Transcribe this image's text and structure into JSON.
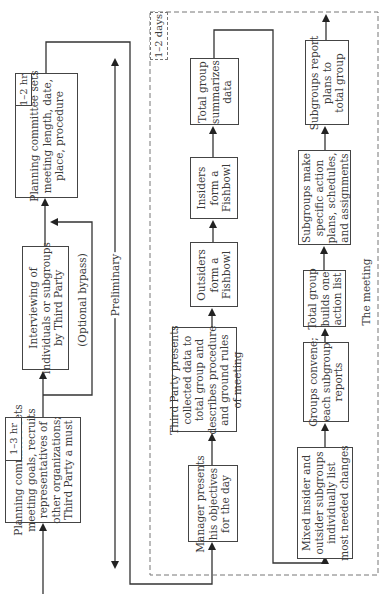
{
  "diagram": {
    "preliminary": {
      "label": "Preliminary",
      "steps": [
        {
          "id": "goals",
          "duration": "1–3 hr",
          "lines": [
            "Planning committee sets",
            "meeting goals, recruits",
            "representatives of",
            "other organizations;",
            "Third Party a must"
          ]
        },
        {
          "id": "interview",
          "lines": [
            "Interviewing of",
            "individuals or subgroups",
            "by Third Party"
          ]
        },
        {
          "id": "logistics",
          "duration": "1–2 hr",
          "lines": [
            "Planning committee sets",
            "meeting length, date,",
            "place, procedure"
          ]
        }
      ],
      "bypass_label": "(Optional bypass)"
    },
    "meeting": {
      "label": "The meeting",
      "duration": "1–2 days",
      "column_a": [
        {
          "id": "manager",
          "lines": [
            "Manager presents",
            "his objectives",
            "for the day"
          ]
        },
        {
          "id": "third-party",
          "lines": [
            "Third Party presents",
            "collected data to",
            "total group and",
            "describes procedure",
            "and ground rules",
            "of meeting"
          ]
        },
        {
          "id": "outsiders",
          "lines": [
            "Outsiders",
            "form a",
            "Fishbowl"
          ]
        },
        {
          "id": "insiders",
          "lines": [
            "Insiders",
            "form a",
            "Fishbowl"
          ]
        },
        {
          "id": "summarize",
          "lines": [
            "Total group",
            "summarizes",
            "data"
          ]
        }
      ],
      "column_b": [
        {
          "id": "mixed",
          "lines": [
            "Mixed insider and",
            "outsider subgroups",
            "individually list",
            "most needed changes"
          ]
        },
        {
          "id": "convene",
          "lines": [
            "Groups convene;",
            "each subgroup",
            "reports"
          ]
        },
        {
          "id": "action-list",
          "lines": [
            "Total group",
            "builds one",
            "action list"
          ]
        },
        {
          "id": "plans",
          "lines": [
            "Subgroups make",
            "specific action",
            "plans, schedules,",
            "and assignments"
          ]
        },
        {
          "id": "report",
          "lines": [
            "Subgroups report",
            "plans to",
            "total group"
          ]
        }
      ]
    },
    "colors": {
      "line": "#333333",
      "box_border": "#444444",
      "text": "#3a3a3a",
      "background": "#ffffff"
    }
  }
}
